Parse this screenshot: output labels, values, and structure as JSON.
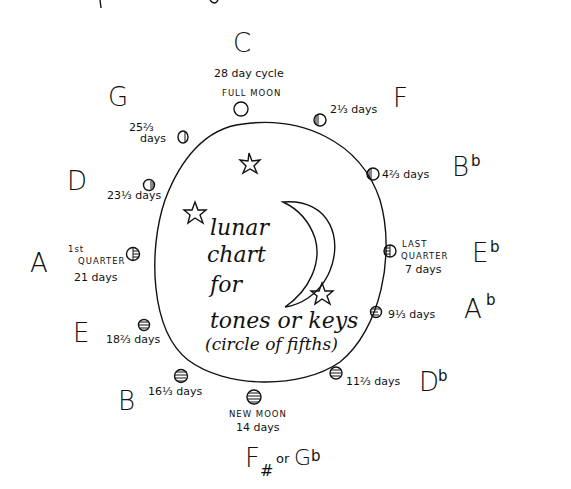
{
  "title": {
    "line1": "lunar",
    "line2": "chart",
    "line3": "for",
    "line4": "tones or keys",
    "line5": "(circle of fifths)"
  },
  "cycle_label": "28 day cycle",
  "positions": [
    {
      "key": "C",
      "phase_label": "FULL MOON",
      "days": "",
      "phase": "full-moon"
    },
    {
      "key": "F",
      "phase_label": "",
      "days": "2⅓ days",
      "phase": "waning-gibbous"
    },
    {
      "key": "B♭",
      "key_base": "B",
      "key_acc": "b",
      "phase_label": "",
      "days": "4⅔ days",
      "phase": "waning-gibbous"
    },
    {
      "key": "E♭",
      "key_base": "E",
      "key_acc": "b",
      "phase_label_1": "LAST",
      "phase_label_2": "QUARTER",
      "days": "7 days",
      "phase": "last-quarter"
    },
    {
      "key": "A♭",
      "key_base": "A",
      "key_acc": "b",
      "phase_label": "",
      "days": "9⅓ days",
      "phase": "waning-crescent"
    },
    {
      "key": "D♭",
      "key_base": "D",
      "key_acc": "b",
      "phase_label": "",
      "days": "11⅔ days",
      "phase": "waning-crescent"
    },
    {
      "key": "F# or G♭",
      "key_base": "F",
      "key_sharp": "#",
      "key_or": "or",
      "key_alt": "G",
      "key_alt_acc": "b",
      "phase_label": "NEW MOON",
      "days": "14 days",
      "phase": "new-moon"
    },
    {
      "key": "B",
      "phase_label": "",
      "days": "16⅓ days",
      "phase": "waxing-crescent"
    },
    {
      "key": "E",
      "phase_label": "",
      "days": "18⅔ days",
      "phase": "waxing-crescent"
    },
    {
      "key": "A",
      "phase_label_1": "1st",
      "phase_label_2": "QUARTER",
      "days": "21 days",
      "phase": "first-quarter"
    },
    {
      "key": "D",
      "phase_label": "",
      "days": "23⅓ days",
      "phase": "waxing-gibbous"
    },
    {
      "key": "G",
      "phase_label": "",
      "days_1": "25⅔",
      "days_2": "days",
      "phase": "waxing-gibbous"
    }
  ],
  "colors": {
    "ink": "#111111",
    "paper": "#ffffff"
  }
}
